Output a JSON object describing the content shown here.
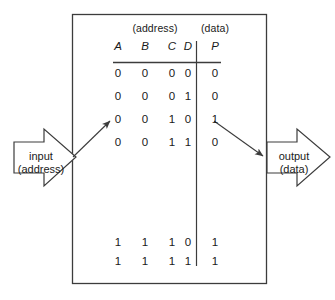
{
  "diagram": {
    "stroke_color": "#3c3c3c",
    "text_color": "#1a1a1a",
    "background": "#ffffff",
    "input_arrow": {
      "name": "input-arrow",
      "label_line1": "input",
      "label_line2": "(address)"
    },
    "output_arrow": {
      "name": "output-arrow",
      "label_line1": "output",
      "label_line2": "(data)"
    },
    "pointer_arrows": {
      "address_pointer_name": "address-row-pointer-arrow",
      "data_pointer_name": "data-value-pointer-arrow"
    }
  },
  "table": {
    "group_headers": {
      "address": "(address)",
      "data": "(data)"
    },
    "columns": {
      "address": [
        "A",
        "B",
        "C",
        "D"
      ],
      "data": [
        "P"
      ]
    },
    "rows_top": [
      {
        "address": [
          "0",
          "0",
          "0",
          "0"
        ],
        "data": [
          "0"
        ]
      },
      {
        "address": [
          "0",
          "0",
          "0",
          "1"
        ],
        "data": [
          "0"
        ]
      },
      {
        "address": [
          "0",
          "0",
          "1",
          "0"
        ],
        "data": [
          "1"
        ]
      },
      {
        "address": [
          "0",
          "0",
          "1",
          "1"
        ],
        "data": [
          "0"
        ]
      }
    ],
    "rows_bottom": [
      {
        "address": [
          "1",
          "1",
          "1",
          "0"
        ],
        "data": [
          "1"
        ]
      },
      {
        "address": [
          "1",
          "1",
          "1",
          "1"
        ],
        "data": [
          "1"
        ]
      }
    ]
  }
}
